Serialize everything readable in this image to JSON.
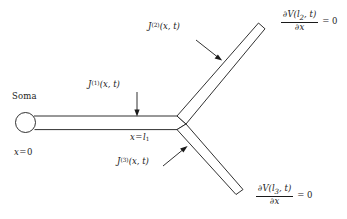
{
  "figure": {
    "background_color": "#ffffff",
    "stroke_color": "#1a1a1a",
    "labels": {
      "soma": "Soma",
      "origin": {
        "var": "x",
        "op": "=",
        "value": "0"
      },
      "junction": {
        "var": "x",
        "op": "=",
        "value": "l",
        "value_sub": "1"
      },
      "current_trunk": {
        "symbol": "J",
        "superscript": "(1)",
        "args": "(x, t)"
      },
      "current_upper": {
        "symbol": "J",
        "superscript": "(2)",
        "args": "(x, t)"
      },
      "current_lower": {
        "symbol": "J",
        "superscript": "(3)",
        "args": "(x, t)"
      },
      "bc_upper": {
        "numerator_partial": "∂",
        "numerator_fn": "V",
        "numerator_args_open": "(",
        "numerator_arg": "l",
        "numerator_arg_sub": "2",
        "numerator_args_rest": ", t)",
        "denominator_partial": "∂",
        "denominator_var": "x",
        "equals": "= 0"
      },
      "bc_lower": {
        "numerator_partial": "∂",
        "numerator_fn": "V",
        "numerator_args_open": "(",
        "numerator_arg": "l",
        "numerator_arg_sub": "3",
        "numerator_args_rest": ", t)",
        "denominator_partial": "∂",
        "denominator_var": "x",
        "equals": "= 0"
      }
    }
  }
}
